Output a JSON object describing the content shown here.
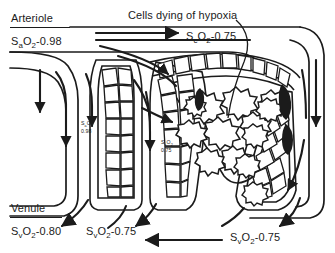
{
  "figure": {
    "background_color": "#ffffff",
    "ink_color": "#1b1b1b"
  },
  "labels": {
    "arteriole": "Arteriole",
    "venule": "Venule",
    "hypoxia_callout": "Cells dying of hypoxia"
  },
  "saturations": {
    "arterial_inlet": {
      "symbol": "S",
      "subscript": "a",
      "gas": "O",
      "gas_subscript": "2",
      "value": "-0.98",
      "full": "SaO2-0.98"
    },
    "capillary_top": {
      "symbol": "S",
      "subscript": "c",
      "gas": "O",
      "gas_subscript": "2",
      "value": "-0.75",
      "full": "ScO2-0.75"
    },
    "venous_left": {
      "symbol": "S",
      "subscript": "v",
      "gas": "O",
      "gas_subscript": "2",
      "value": "-0.80",
      "full": "SvO2-0.80"
    },
    "venous_mid": {
      "symbol": "S",
      "subscript": "v",
      "gas": "O",
      "gas_subscript": "2",
      "value": "-0.75",
      "full": "SvO2-0.75"
    },
    "venous_bottom": {
      "symbol": "S",
      "subscript": "v",
      "gas": "O",
      "gas_subscript": "2",
      "value": "-0.75",
      "full": "SvO2-0.75"
    },
    "inline_arterial": {
      "symbol": "S",
      "subscript": "a",
      "gas": "O",
      "gas_subscript": "2",
      "value": "0.98",
      "full": "SaO2 0.98"
    },
    "inline_capillary": {
      "symbol": "S",
      "subscript": "c",
      "gas": "O",
      "gas_subscript": "2",
      "value": "0.75",
      "full": "ScO2 0.75"
    }
  },
  "diagram_elements": {
    "vessel_loop": "arteriole-to-venule vascular loop",
    "capillary_beds": "columns of polygonal endothelial cells",
    "necrotic_core": "dark jagged cells in central wedge",
    "flow_arrows": "directional blood flow arrows"
  }
}
